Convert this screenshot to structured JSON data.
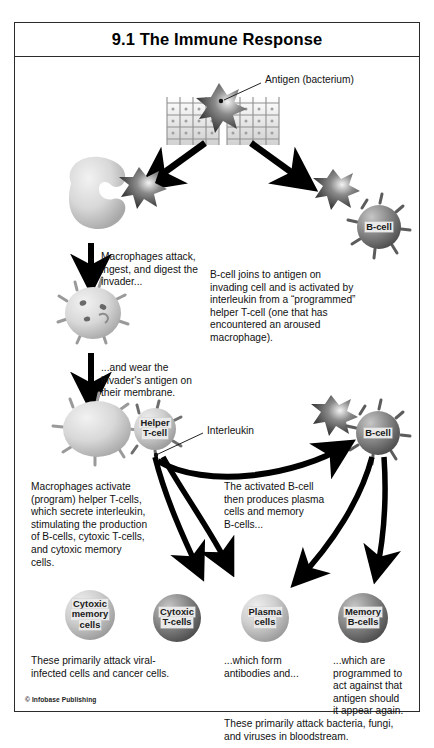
{
  "figure": {
    "title": "9.1 The Immune Response",
    "copyright": "© Infobase Publishing"
  },
  "callouts": {
    "antigen": "Antigen (bacterium)",
    "interleukin": "Interleukin"
  },
  "cells": {
    "bcell_top": "B-cell",
    "bcell_mid": "B-cell",
    "helper_tcell": "Helper\nT-cell",
    "helper_tcell_line1": "Helper",
    "helper_tcell_line2": "T-cell",
    "cytoxic_memory_line1": "Cytoxic",
    "cytoxic_memory_line2": "memory",
    "cytoxic_memory_line3": "cells",
    "cytoxic_tcells_line1": "Cytoxic",
    "cytoxic_tcells_line2": "T-cells",
    "plasma_line1": "Plasma",
    "plasma_line2": "cells",
    "memory_bcells_line1": "Memory",
    "memory_bcells_line2": "B-cells"
  },
  "text_blocks": {
    "macrophage_attack": "Macrophages attack,\ningest, and digest the\ninvader...",
    "wear_antigen": "...and wear the\ninvader's antigen on\ntheir membrane.",
    "bcell_joins": "B-cell joins to antigen on\ninvading cell and is activated by\ninterleukin from a “programmed”\nhelper T-cell (one that has\nencountered an aroused\nmacrophage).",
    "macrophages_activate": "Macrophages activate\n(program) helper T-cells,\nwhich secrete interleukin,\nstimulating the production\nof B-cells, cytoxic T-cells,\nand cytoxic memory\ncells.",
    "activated_bcell": "The activated B-cell\nthen produces plasma\ncells and memory\nB-cells...",
    "attack_viral": "These primarily attack viral-\ninfected cells and cancer cells.",
    "form_antibodies": "...which form\nantibodies and...",
    "programmed_act": "...which are\nprogrammed to\nact against that\nantigen should\nit appear again.",
    "attack_bacteria": "These primarily attack bacteria, fungi,\nand viruses in bloodstream."
  },
  "colors": {
    "border": "#2b2b2b",
    "text": "#111111",
    "arrow": "#000000",
    "cell_light": "#d9d9d9",
    "cell_dark": "#707070",
    "label_bg": "#e9e9e9"
  }
}
